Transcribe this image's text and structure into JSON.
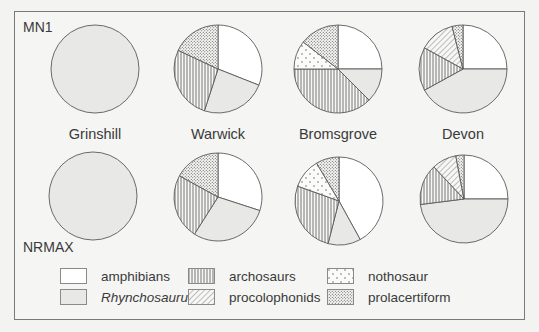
{
  "labels": {
    "row1": "MN1",
    "row2": "NRMAX",
    "sites": [
      "Grinshill",
      "Warwick",
      "Bromsgrove",
      "Devon"
    ]
  },
  "legend": [
    {
      "key": "amphibians",
      "label": "amphibians",
      "italic": false
    },
    {
      "key": "archosaurs",
      "label": "archosaurs",
      "italic": false
    },
    {
      "key": "nothosaur",
      "label": "nothosaur",
      "italic": false
    },
    {
      "key": "rhynchosaurus",
      "label": "Rhynchosaurus",
      "italic": true
    },
    {
      "key": "procolophonids",
      "label": "procolophonids",
      "italic": false
    },
    {
      "key": "prolacertiform",
      "label": "prolacertiform",
      "italic": false
    }
  ],
  "colors": {
    "stroke": "#5a5a5a",
    "amphibians": "#ffffff",
    "rhynchosaurus": "#e8e8e6",
    "background": "#f5f5f3"
  },
  "chart_data": {
    "type": "pie",
    "title": "",
    "row_labels": [
      "MN1",
      "NRMAX"
    ],
    "categories": [
      "amphibians",
      "Rhynchosaurus",
      "archosaurs",
      "procolophonids",
      "nothosaur",
      "prolacertiform"
    ],
    "legend_position": "bottom",
    "pies": [
      {
        "row": "MN1",
        "site": "Grinshill",
        "slices": {
          "amphibians": 0,
          "Rhynchosaurus": 100,
          "archosaurs": 0,
          "procolophonids": 0,
          "nothosaur": 0,
          "prolacertiform": 0
        }
      },
      {
        "row": "MN1",
        "site": "Warwick",
        "slices": {
          "amphibians": 31,
          "Rhynchosaurus": 24,
          "archosaurs": 27,
          "procolophonids": 0,
          "nothosaur": 0,
          "prolacertiform": 18
        }
      },
      {
        "row": "MN1",
        "site": "Bromsgrove",
        "slices": {
          "amphibians": 25,
          "Rhynchosaurus": 12.5,
          "archosaurs": 37.5,
          "procolophonids": 0,
          "nothosaur": 10.5,
          "prolacertiform": 14.5
        }
      },
      {
        "row": "MN1",
        "site": "Devon",
        "slices": {
          "amphibians": 25,
          "Rhynchosaurus": 42,
          "archosaurs": 16,
          "procolophonids": 13,
          "nothosaur": 0,
          "prolacertiform": 4
        }
      },
      {
        "row": "NRMAX",
        "site": "Grinshill",
        "slices": {
          "amphibians": 0,
          "Rhynchosaurus": 100,
          "archosaurs": 0,
          "procolophonids": 0,
          "nothosaur": 0,
          "prolacertiform": 0
        }
      },
      {
        "row": "NRMAX",
        "site": "Warwick",
        "slices": {
          "amphibians": 30,
          "Rhynchosaurus": 29,
          "archosaurs": 24,
          "procolophonids": 0,
          "nothosaur": 0,
          "prolacertiform": 17
        }
      },
      {
        "row": "NRMAX",
        "site": "Bromsgrove",
        "slices": {
          "amphibians": 42,
          "Rhynchosaurus": 12,
          "archosaurs": 26.5,
          "procolophonids": 0,
          "nothosaur": 11,
          "prolacertiform": 8.5
        }
      },
      {
        "row": "NRMAX",
        "site": "Devon",
        "slices": {
          "amphibians": 25,
          "Rhynchosaurus": 48,
          "archosaurs": 15,
          "procolophonids": 9,
          "nothosaur": 0,
          "prolacertiform": 3
        }
      }
    ]
  }
}
